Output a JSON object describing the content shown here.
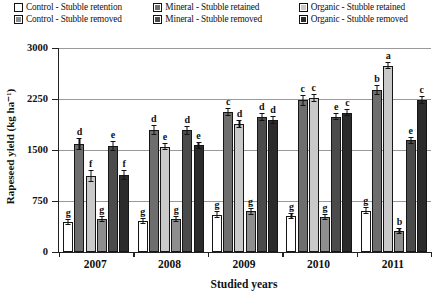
{
  "legend": {
    "rows": [
      [
        {
          "label": "Control - Stubble retention",
          "swatch": "open-white-square"
        },
        {
          "label": "Mineral - Stubble retained",
          "swatch": "dark-gray-square"
        },
        {
          "label": "Organic - Stubble retained",
          "swatch": "light-gray-square"
        }
      ],
      [
        {
          "label": "Control - Stubble removed",
          "swatch": "medium-gray-square"
        },
        {
          "label": "Mineral - Stubble removed",
          "swatch": "darker-gray-square"
        },
        {
          "label": "Organic - Stubble removed",
          "swatch": "darkest-gray-square"
        }
      ]
    ]
  },
  "axes": {
    "ytitle": "Rapeseed yield (kg ha⁻¹)",
    "xtitle": "Studied years",
    "yticks": [
      "3000",
      "2250",
      "1500",
      "750",
      "0"
    ]
  },
  "colors": {
    "series": [
      "#ffffff",
      "#6e6e6e",
      "#c9c9c9",
      "#8e8e8e",
      "#4b4b4b",
      "#2b2b2b"
    ],
    "axis": "#222222",
    "grid": "#9a9a9a"
  },
  "chart_data": {
    "type": "bar",
    "title": "",
    "subtitle": "",
    "xlabel": "Studied years",
    "ylabel": "Rapeseed yield (kg ha⁻¹)",
    "ylim": [
      0,
      3000
    ],
    "yticks": [
      0,
      750,
      1500,
      2250,
      3000
    ],
    "grid": true,
    "legend_position": "top",
    "categories": [
      "2007",
      "2008",
      "2009",
      "2010",
      "2011"
    ],
    "series": [
      {
        "name": "Control - Stubble retention",
        "values": [
          440,
          450,
          550,
          530,
          610
        ],
        "errors": [
          45,
          45,
          50,
          50,
          55
        ],
        "letters": [
          "g",
          "g",
          "g",
          "g",
          "g"
        ]
      },
      {
        "name": "Mineral - Stubble retained",
        "values": [
          1590,
          1790,
          2060,
          2230,
          2380
        ],
        "errors": [
          90,
          75,
          65,
          80,
          75
        ],
        "letters": [
          "d",
          "d",
          "c",
          "c",
          "b"
        ]
      },
      {
        "name": "Organic - Stubble retained",
        "values": [
          1120,
          1550,
          1880,
          2270,
          2740
        ],
        "errors": [
          85,
          55,
          60,
          60,
          55
        ],
        "letters": [
          "f",
          "e",
          "d",
          "c",
          "a"
        ]
      },
      {
        "name": "Control - Stubble removed",
        "values": [
          480,
          490,
          600,
          520,
          310
        ],
        "errors": [
          45,
          45,
          50,
          45,
          45
        ],
        "letters": [
          "g",
          "g",
          "g",
          "g",
          "b"
        ]
      },
      {
        "name": "Mineral - Stubble removed",
        "values": [
          1560,
          1790,
          1980,
          1990,
          1640
        ],
        "errors": [
          70,
          70,
          60,
          55,
          55
        ],
        "letters": [
          "e",
          "d",
          "d",
          "e",
          "e"
        ]
      },
      {
        "name": "Organic - Stubble removed",
        "values": [
          1130,
          1570,
          1940,
          2050,
          2230
        ],
        "errors": [
          75,
          55,
          55,
          55,
          60
        ],
        "letters": [
          "f",
          "e",
          "d",
          "c",
          "c"
        ]
      }
    ]
  }
}
